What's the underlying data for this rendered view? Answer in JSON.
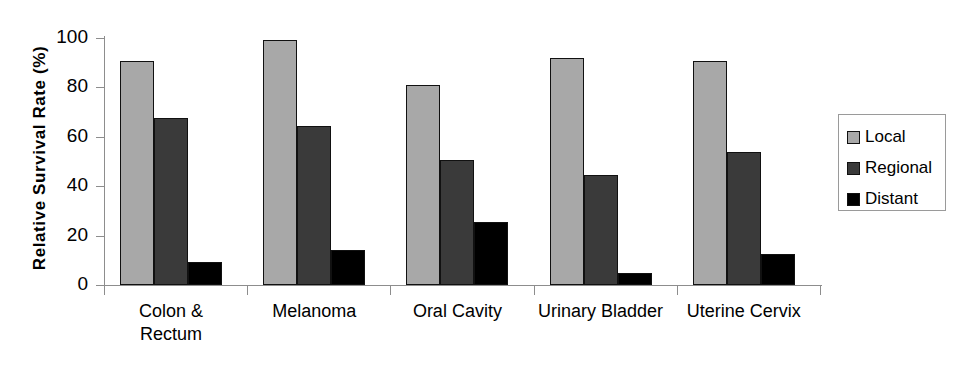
{
  "chart_data": {
    "type": "bar",
    "title": "",
    "xlabel": "",
    "ylabel": "Relative Survival Rate (%)",
    "ylim": [
      0,
      100
    ],
    "yticks": [
      0,
      20,
      40,
      60,
      80,
      100
    ],
    "grid": false,
    "legend_position": "right",
    "categories": [
      "Colon &\nRectum",
      "Melanoma",
      "Oral Cavity",
      "Urinary Bladder",
      "Uterine Cervix"
    ],
    "series": [
      {
        "name": "Local",
        "color": "#a8a8a8",
        "values": [
          90.5,
          99.0,
          81.0,
          92.0,
          90.5
        ]
      },
      {
        "name": "Regional",
        "color": "#3a3a3a",
        "values": [
          67.5,
          64.5,
          50.5,
          44.5,
          54.0
        ]
      },
      {
        "name": "Distant",
        "color": "#000000",
        "values": [
          9.5,
          14.0,
          25.5,
          5.0,
          12.5
        ]
      }
    ]
  }
}
